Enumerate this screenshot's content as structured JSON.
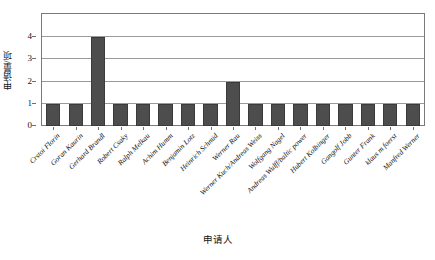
{
  "chart_data": {
    "type": "bar",
    "title": "",
    "subtitle": "",
    "xlabel": "申请人",
    "ylabel": "申请量/项",
    "ylim": [
      0,
      5
    ],
    "yticks": [
      0,
      1,
      2,
      3,
      4
    ],
    "ytick_labels": [
      "0",
      "1",
      "2",
      "3",
      "4"
    ],
    "grid": "horizontal",
    "legend": "none",
    "bar_color": "#4d4d4d",
    "categories": [
      "Crstoi Florin",
      "Goran Kaurin",
      "Gerhard Brandl",
      "Robert Csaky",
      "Ralph Melkau",
      "Achim Humm",
      "Benjamin Lotz",
      "Heinrich Schmid",
      "Werner Rau",
      "Werner Kuch/Andreas Weiss",
      "Wolfgang Nagel",
      "Andreas Wulff/baltic power",
      "Hubert Kolbinger",
      "Gangolf Jobb",
      "Gunter Frank",
      "klaus m foerst",
      "Manfred Werner"
    ],
    "values": [
      1,
      1,
      4,
      1,
      1,
      1,
      1,
      1,
      2,
      1,
      1,
      1,
      1,
      1,
      1,
      1,
      1
    ]
  },
  "colors": {
    "bar_fill": "#4d4d4d",
    "bar_stroke": "#3a3a3a",
    "grid": "#9a9a9a",
    "frame": "#7a7a7a",
    "text": "#141414",
    "background": "#ffffff"
  }
}
